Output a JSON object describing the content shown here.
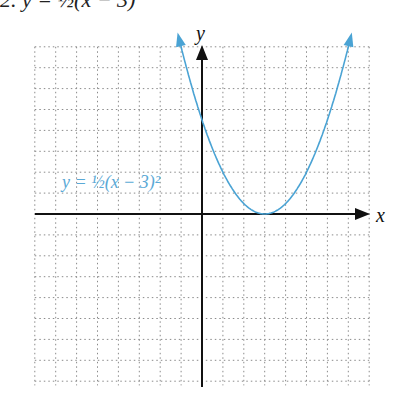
{
  "header": {
    "clipped_text": "2.  y = ½(x − 3)"
  },
  "colors": {
    "curve": "#4aa3d4",
    "axis": "#111111",
    "grid": "#888888"
  },
  "chart_data": {
    "type": "line",
    "title": "",
    "equation_label": "y = ½(x − 3)²",
    "xlabel": "x",
    "ylabel": "y",
    "xlim": [
      -8,
      8
    ],
    "ylim": [
      -8,
      8
    ],
    "grid": true,
    "series": [
      {
        "name": "y = ½(x − 3)²",
        "x": [
          -1.2,
          -1,
          0,
          1,
          2,
          3,
          4,
          5,
          6,
          7,
          7.2
        ],
        "values": [
          8.8,
          8,
          4.5,
          2,
          0.5,
          0,
          0.5,
          2,
          4.5,
          8,
          8.8
        ]
      }
    ]
  },
  "labels": {
    "x_axis": "x",
    "y_axis": "y",
    "equation": "y = ½(x − 3)²"
  }
}
